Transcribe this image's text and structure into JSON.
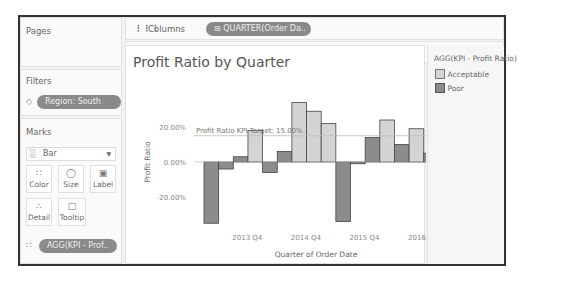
{
  "shelves": {
    "pages_label": "Pages",
    "columns_label": "Columns",
    "columns_pill": "QUARTER(Order Da..",
    "rows_label": "Rows",
    "rows_pill": "AGG(Profit Ratio)"
  },
  "filters": {
    "label": "Filters",
    "items": [
      {
        "label": "Region: South"
      }
    ]
  },
  "marks": {
    "label": "Marks",
    "type_selected": "Bar",
    "cards": [
      {
        "label": "Color",
        "icon": "color-dots-icon"
      },
      {
        "label": "Size",
        "icon": "size-icon"
      },
      {
        "label": "Label",
        "icon": "label-icon"
      },
      {
        "label": "Detail",
        "icon": "detail-icon"
      },
      {
        "label": "Tooltip",
        "icon": "tooltip-icon"
      }
    ],
    "color_pill": "AGG(KPI - Prof.."
  },
  "view": {
    "title": "Profit Ratio by Quarter",
    "reference_line_label": "Profit Ratio KPI Target: 15.00%"
  },
  "legend": {
    "title": "AGG(KPI - Profit Ratio)",
    "items": [
      {
        "label": "Acceptable",
        "color": "#d4d4d4"
      },
      {
        "label": "Poor",
        "color": "#8c8c8c"
      }
    ]
  },
  "colors": {
    "acceptable": "#d4d4d4",
    "poor": "#8c8c8c",
    "pill": "#8a8a8a",
    "reference_line": "#bbbbbb"
  },
  "chart_data": {
    "type": "bar",
    "title": "Profit Ratio by Quarter",
    "xlabel": "Quarter of Order Date",
    "ylabel": "Profit Ratio",
    "x_tick_labels": [
      "2013 Q4",
      "2014 Q4",
      "2015 Q4",
      "2016 Q4"
    ],
    "y_tick_labels": [
      "20.00%",
      "0.00%",
      "-20.00%"
    ],
    "ylim": [
      -35,
      35
    ],
    "grid": false,
    "legend_position": "right",
    "reference_line": {
      "label": "Profit Ratio KPI Target: 15.00%",
      "value": 15
    },
    "categories": [
      "2013 Q1",
      "2013 Q2",
      "2013 Q3",
      "2013 Q4",
      "2014 Q1",
      "2014 Q2",
      "2014 Q3",
      "2014 Q4",
      "2015 Q1",
      "2015 Q2",
      "2015 Q3",
      "2015 Q4",
      "2016 Q1",
      "2016 Q2",
      "2016 Q3",
      "2016 Q4"
    ],
    "values": [
      -35,
      -4,
      3,
      18,
      -6,
      6,
      34,
      29,
      22,
      -34,
      -1,
      14,
      24,
      10,
      19,
      5
    ],
    "kpi": [
      "Poor",
      "Poor",
      "Poor",
      "Acceptable",
      "Poor",
      "Poor",
      "Acceptable",
      "Acceptable",
      "Acceptable",
      "Poor",
      "Poor",
      "Poor",
      "Acceptable",
      "Poor",
      "Acceptable",
      "Poor"
    ]
  }
}
